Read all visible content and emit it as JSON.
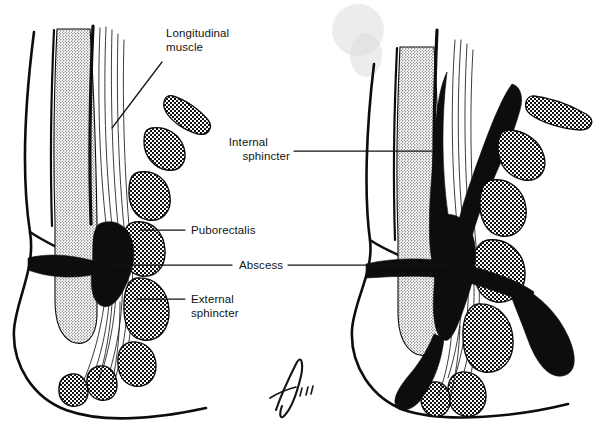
{
  "figure": {
    "background_color": "#ffffff",
    "ink_color": "#0d0d0d",
    "width": 609,
    "height": 444
  },
  "labels": {
    "longitudinal_muscle": {
      "line1": "Longitudinal",
      "line2": "muscle"
    },
    "internal_sphincter": {
      "line1": "Internal",
      "line2": "sphincter"
    },
    "puborectalis": "Puborectalis",
    "abscess": "Abscess",
    "external_sphincter": {
      "line1": "External",
      "line2": "sphincter"
    }
  },
  "panels": [
    {
      "name": "left-panel",
      "description": "Intersphincteric / perianal abscess, localized"
    },
    {
      "name": "right-panel",
      "description": "Extensive abscess with supralevator and ischiorectal extension"
    }
  ],
  "signature": {
    "artist_mark": "signature",
    "year_mark": "'79"
  },
  "legend_note": {
    "stipple": "internal sphincter (fine stipple)",
    "crosshatch": "striated muscle (puborectalis / external sphincter)",
    "solid_black": "abscess cavity"
  }
}
